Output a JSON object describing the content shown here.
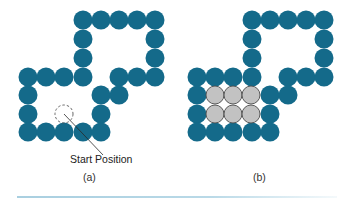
{
  "colors": {
    "wall": "#146a8a",
    "filled": "#c2c2c2",
    "filled_stroke": "#4a4a4a",
    "dashed": "#555555",
    "rule": "#a9cfe0"
  },
  "diagram": {
    "panels": [
      {
        "id": "a",
        "caption": "(a)",
        "offset_x": 0,
        "wall_circles": [
          [
            83,
            20
          ],
          [
            101,
            20
          ],
          [
            119,
            20
          ],
          [
            137,
            20
          ],
          [
            155,
            20
          ],
          [
            83,
            39
          ],
          [
            155,
            39
          ],
          [
            83,
            58
          ],
          [
            155,
            58
          ],
          [
            28,
            77
          ],
          [
            46,
            77
          ],
          [
            64,
            77
          ],
          [
            83,
            77
          ],
          [
            119,
            77
          ],
          [
            137,
            77
          ],
          [
            155,
            77
          ],
          [
            28,
            95
          ],
          [
            101,
            95
          ],
          [
            119,
            95
          ],
          [
            28,
            114
          ],
          [
            101,
            114
          ],
          [
            28,
            132
          ],
          [
            46,
            132
          ],
          [
            64,
            132
          ],
          [
            83,
            132
          ],
          [
            101,
            132
          ]
        ],
        "start_marker": {
          "cx": 64,
          "cy": 114,
          "r": 9
        },
        "annotation": {
          "text": "Start Position",
          "line": [
            64,
            114,
            103,
            155
          ]
        }
      },
      {
        "id": "b",
        "caption": "(b)",
        "offset_x": 169,
        "wall_circles": [
          [
            83,
            20
          ],
          [
            101,
            20
          ],
          [
            119,
            20
          ],
          [
            137,
            20
          ],
          [
            155,
            20
          ],
          [
            83,
            39
          ],
          [
            155,
            39
          ],
          [
            83,
            58
          ],
          [
            155,
            58
          ],
          [
            28,
            77
          ],
          [
            46,
            77
          ],
          [
            64,
            77
          ],
          [
            83,
            77
          ],
          [
            119,
            77
          ],
          [
            137,
            77
          ],
          [
            155,
            77
          ],
          [
            28,
            95
          ],
          [
            101,
            95
          ],
          [
            119,
            95
          ],
          [
            28,
            114
          ],
          [
            101,
            114
          ],
          [
            28,
            132
          ],
          [
            46,
            132
          ],
          [
            64,
            132
          ],
          [
            83,
            132
          ],
          [
            101,
            132
          ]
        ],
        "filled_circles": [
          [
            46,
            95
          ],
          [
            64,
            95
          ],
          [
            82,
            95
          ],
          [
            46,
            114
          ],
          [
            64,
            114
          ],
          [
            82,
            114
          ]
        ]
      }
    ],
    "circle_radius": 9.5
  }
}
